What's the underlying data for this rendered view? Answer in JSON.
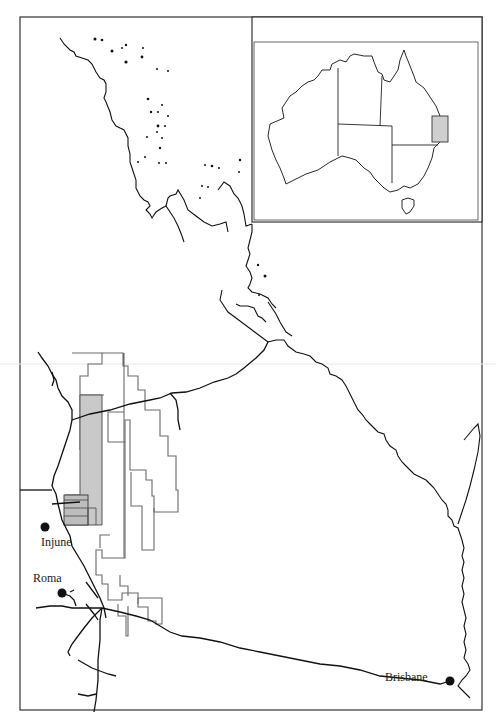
{
  "map": {
    "title": "",
    "places": [
      {
        "name": "Injune",
        "x": 45,
        "y": 527,
        "label_x": 41,
        "label_y": 545
      },
      {
        "name": "Roma",
        "x": 62,
        "y": 593,
        "label_x": 33,
        "label_y": 581
      },
      {
        "name": "Brisbane",
        "x": 450,
        "y": 681,
        "label_x": 385,
        "label_y": 677
      }
    ],
    "inset": {
      "description": "Australia locator map",
      "highlight_region": "Queensland study area"
    },
    "colors": {
      "coast": "#111111",
      "tenement_outline": "#666666",
      "shaded_area": "#c8c8c8",
      "road": "#111111",
      "frame": "#333333"
    }
  }
}
